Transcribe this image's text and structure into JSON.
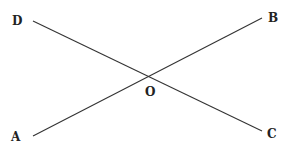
{
  "diagram": {
    "type": "intersecting-lines",
    "background": "#ffffff",
    "line_color": "#333333",
    "points": {
      "D": {
        "label": "D",
        "x": 33,
        "y": 21,
        "label_x": 12,
        "label_y": 25
      },
      "B": {
        "label": "B",
        "x": 262,
        "y": 18,
        "label_x": 268,
        "label_y": 22
      },
      "A": {
        "label": "A",
        "x": 33,
        "y": 136,
        "label_x": 11,
        "label_y": 141
      },
      "C": {
        "label": "C",
        "x": 262,
        "y": 131,
        "label_x": 267,
        "label_y": 138
      },
      "O": {
        "label": "O",
        "x": 150,
        "y": 76,
        "label_x": 145,
        "label_y": 96
      }
    },
    "lines": [
      {
        "name": "line-DC",
        "from": "D",
        "to": "C"
      },
      {
        "name": "line-AB",
        "from": "A",
        "to": "B"
      }
    ]
  }
}
